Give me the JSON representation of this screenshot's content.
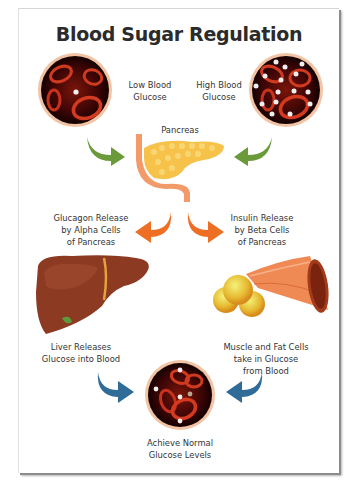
{
  "diagram": {
    "title": "Blood Sugar Regulation",
    "nodes": {
      "low_glucose": {
        "line1": "Low Blood",
        "line2": "Glucose"
      },
      "high_glucose": {
        "line1": "High Blood",
        "line2": "Glucose"
      },
      "pancreas": {
        "label": "Pancreas"
      },
      "glucagon": {
        "line1": "Glucagon Release",
        "line2": "by Alpha Cells",
        "line3": "of Pancreas"
      },
      "insulin": {
        "line1": "Insulin Release",
        "line2": "by Beta Cells",
        "line3": "of Pancreas"
      },
      "liver": {
        "line1": "Liver Releases",
        "line2": "Glucose into Blood"
      },
      "muscle_fat": {
        "line1": "Muscle and Fat Cells",
        "line2": "take in Glucose",
        "line3": "from Blood"
      },
      "normal": {
        "line1": "Achieve Normal",
        "line2": "Glucose Levels"
      }
    },
    "colors": {
      "arrow_green": "#6a9a3a",
      "arrow_orange": "#ee6f23",
      "arrow_blue": "#2f6c98",
      "blood_dark": "#2a0404",
      "blood_cell": "#c8321c",
      "circle_ring": "#f2c3a4",
      "pancreas": "#f6c24a",
      "liver": "#8c3a22",
      "muscle": "#f08a55",
      "fat": "#e8c23a"
    }
  }
}
